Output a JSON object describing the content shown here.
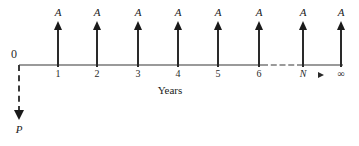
{
  "diagram": {
    "axis_caption": "Years",
    "origin_label": "0",
    "present_value_label": "P",
    "flow_label": "A",
    "colors": {
      "axis": "#9a9a9a",
      "arrow": "#2a2a2a",
      "text": "#1a1a1a"
    },
    "periods": [
      {
        "tick": "1",
        "label": "A",
        "x": 58
      },
      {
        "tick": "2",
        "label": "A",
        "x": 97
      },
      {
        "tick": "3",
        "label": "A",
        "x": 138
      },
      {
        "tick": "4",
        "label": "A",
        "x": 178
      },
      {
        "tick": "5",
        "label": "A",
        "x": 218
      },
      {
        "tick": "6",
        "label": "A",
        "x": 259
      },
      {
        "tick": "N",
        "label": "A",
        "x": 303
      },
      {
        "tick": "∞",
        "label": "A",
        "x": 341
      }
    ],
    "continuation_marker": "▶"
  }
}
